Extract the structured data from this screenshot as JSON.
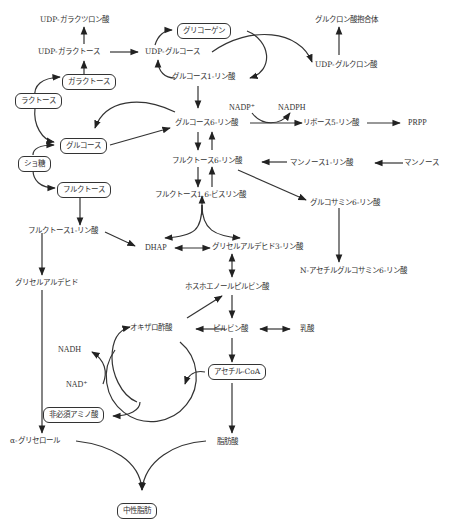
{
  "diagram": {
    "title": "",
    "nodes": {
      "udp_galacturonic": "UDP-ガラクツロン酸",
      "udp_galactose": "UDP-ガラクトース",
      "galactose": "ガラクトース",
      "lactose": "ラクトース",
      "glucose": "グルコース",
      "sucrose": "ショ糖",
      "fructose": "フルクトース",
      "fructose_1p": "フルクトース1-リン酸",
      "glyceraldehyde": "グリセルアルデヒド",
      "alpha_glycerol": "α-グリセロール",
      "glycogen": "グリコーゲン",
      "udp_glucose": "UDP-グルコース",
      "glucose_1p": "グルコース1-リン酸",
      "glucuronide": "グルクロン酸抱合体",
      "udp_glucuronic": "UDP-グルクロン酸",
      "nadp": "NADP⁺",
      "nadph": "NADPH",
      "glucose_6p": "グルコース6-リン酸",
      "ribose_5p": "リボース5-リン酸",
      "prpp": "PRPP",
      "fructose_6p": "フルクトース6-リン酸",
      "mannose_1p": "マンノース1-リン酸",
      "mannose": "マンノース",
      "fructose_16bp": "フルクトース1,6-ビスリン酸",
      "glucosamine_6p": "グルコサミン6-リン酸",
      "dhap": "DHAP",
      "gap": "グリセルアルデヒド3-リン酸",
      "nacetylglucosamine_6p": "N-アセチルグルコサミン6-リン酸",
      "pep": "ホスホエノールピルビン酸",
      "oxaloacetate": "オキザロ酢酸",
      "pyruvate": "ピルビン酸",
      "lactate": "乳酸",
      "nadh": "NADH",
      "nad": "NAD⁺",
      "acetyl_coa": "アセチル-CoA",
      "nonessential_aa": "非必須アミノ酸",
      "fatty_acid": "脂肪酸",
      "neutral_fat": "中性脂肪"
    },
    "boxed_nodes": [
      "galactose",
      "lactose",
      "glucose",
      "sucrose",
      "fructose",
      "glycogen",
      "acetyl_coa",
      "nonessential_aa",
      "neutral_fat"
    ],
    "colors": {
      "line": "#333333",
      "background": "#ffffff"
    }
  }
}
